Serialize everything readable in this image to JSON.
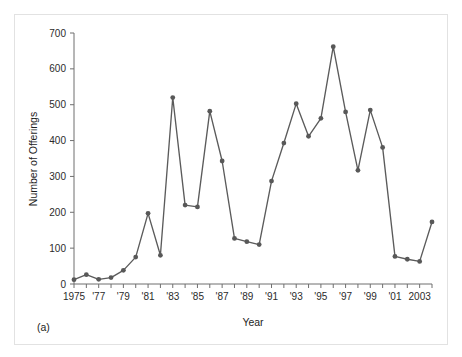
{
  "figure": {
    "panel_label": "(a)",
    "background_color": "#ffffff",
    "frame_border_color": "#e2e2e2"
  },
  "chart_data": {
    "type": "line",
    "title": "",
    "subtitle": "",
    "xlabel": "Year",
    "ylabel": "Number of Offerings",
    "xlim": [
      1975,
      2004
    ],
    "ylim": [
      0,
      700
    ],
    "grid": false,
    "legend": null,
    "legend_position": "none",
    "marker": "circle",
    "line_color": "#5b5b5b",
    "marker_color": "#585858",
    "x": [
      1975,
      1976,
      1977,
      1978,
      1979,
      1980,
      1981,
      1982,
      1983,
      1984,
      1985,
      1986,
      1987,
      1988,
      1989,
      1990,
      1991,
      1992,
      1993,
      1994,
      1995,
      1996,
      1997,
      1998,
      1999,
      2000,
      2001,
      2002,
      2003,
      2004
    ],
    "values": [
      12,
      26,
      13,
      18,
      38,
      75,
      197,
      80,
      520,
      220,
      215,
      482,
      343,
      127,
      118,
      110,
      287,
      393,
      503,
      412,
      462,
      662,
      480,
      317,
      485,
      381,
      77,
      69,
      63,
      173
    ],
    "x_tick_labels": [
      "1975",
      "'77",
      "'79",
      "'81",
      "'83",
      "'85",
      "'87",
      "'89",
      "'91",
      "'93",
      "'95",
      "'97",
      "'99",
      "'01",
      "2003"
    ],
    "x_tick_label_values": [
      1975,
      1977,
      1979,
      1981,
      1983,
      1985,
      1987,
      1989,
      1991,
      1993,
      1995,
      1997,
      1999,
      2001,
      2003
    ],
    "x_minor_ticks": [
      1975,
      1976,
      1977,
      1978,
      1979,
      1980,
      1981,
      1982,
      1983,
      1984,
      1985,
      1986,
      1987,
      1988,
      1989,
      1990,
      1991,
      1992,
      1993,
      1994,
      1995,
      1996,
      1997,
      1998,
      1999,
      2000,
      2001,
      2002,
      2003,
      2004
    ],
    "y_tick_labels": [
      "0",
      "100",
      "200",
      "300",
      "400",
      "500",
      "600",
      "700"
    ],
    "y_tick_values": [
      0,
      100,
      200,
      300,
      400,
      500,
      600,
      700
    ],
    "annotations": []
  }
}
